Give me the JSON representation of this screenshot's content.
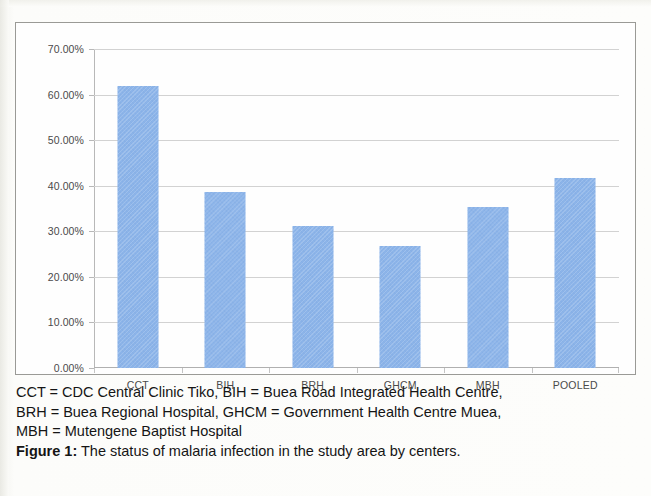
{
  "figure": {
    "label": "Figure 1:",
    "caption_text": " The status of malaria infection in the study area by centers.",
    "abbrev_lines": [
      "CCT = CDC Central Clinic Tiko, BIH = Buea Road Integrated Health Centre,",
      "BRH = Buea Regional Hospital, GHCM = Government Health Centre Muea,",
      "MBH = Mutengene Baptist Hospital"
    ]
  },
  "colors": {
    "bar": "#8cb4e9",
    "gridline": "#d2d2d2",
    "frame": "#9a9a96",
    "axis_text": "#4a4a4a"
  },
  "chart_data": {
    "type": "bar",
    "title": "",
    "xlabel": "",
    "ylabel": "",
    "categories": [
      "CCT",
      "BIH",
      "BRH",
      "GHCM",
      "MBH",
      "POOLED"
    ],
    "values": [
      61.8,
      38.7,
      31.1,
      26.7,
      35.4,
      41.6
    ],
    "value_labels": [
      "61.80%",
      "38.70%",
      "31.10%",
      "26.70%",
      "35.40%",
      "41.60%"
    ],
    "ylim": [
      0,
      70
    ],
    "ytick_values": [
      0,
      10,
      20,
      30,
      40,
      50,
      60,
      70
    ],
    "ytick_labels": [
      "0.00%",
      "10.00%",
      "20.00%",
      "30.00%",
      "40.00%",
      "50.00%",
      "60.00%",
      "70.00%"
    ],
    "grid": true,
    "grid_axis": "y",
    "legend": false,
    "legend_position": "none",
    "series": [
      {
        "name": "Malaria infection prevalence",
        "values": [
          61.8,
          38.7,
          31.1,
          26.7,
          35.4,
          41.6
        ]
      }
    ]
  }
}
